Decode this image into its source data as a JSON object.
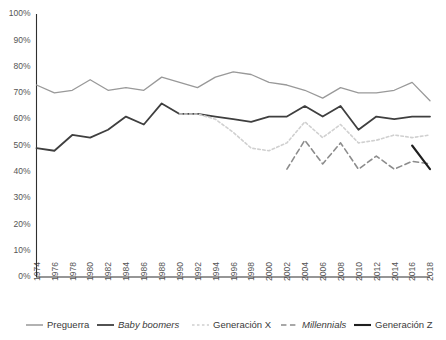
{
  "chart_data": {
    "type": "line",
    "title": "",
    "xlabel": "",
    "ylabel": "",
    "ylim": [
      0,
      100
    ],
    "xlim": [
      1974,
      2018
    ],
    "grid": false,
    "legend_position": "bottom",
    "ytick_labels": [
      "0%",
      "10%",
      "20%",
      "30%",
      "40%",
      "50%",
      "60%",
      "70%",
      "80%",
      "90%",
      "100%"
    ],
    "ytick_values": [
      0,
      10,
      20,
      30,
      40,
      50,
      60,
      70,
      80,
      90,
      100
    ],
    "xtick_labels": [
      "1974",
      "1976",
      "1978",
      "1980",
      "1982",
      "1984",
      "1986",
      "1988",
      "1990",
      "1992",
      "1994",
      "1996",
      "1998",
      "2000",
      "2002",
      "2004",
      "2006",
      "2008",
      "2010",
      "2012",
      "2014",
      "2016",
      "2018"
    ],
    "xtick_values": [
      1974,
      1976,
      1978,
      1980,
      1982,
      1984,
      1986,
      1988,
      1990,
      1992,
      1994,
      1996,
      1998,
      2000,
      2002,
      2004,
      2006,
      2008,
      2010,
      2012,
      2014,
      2016,
      2018
    ],
    "series": [
      {
        "name": "Preguerra",
        "color": "#999999",
        "style": "solid",
        "width": 1.3,
        "italic": false,
        "x": [
          1974,
          1976,
          1978,
          1980,
          1982,
          1984,
          1986,
          1988,
          1990,
          1992,
          1994,
          1996,
          1998,
          2000,
          2002,
          2004,
          2006,
          2008,
          2010,
          2012,
          2014,
          2016,
          2018
        ],
        "values": [
          73,
          70,
          71,
          75,
          71,
          72,
          71,
          76,
          74,
          72,
          76,
          78,
          77,
          74,
          73,
          71,
          68,
          72,
          70,
          70,
          71,
          74,
          67
        ]
      },
      {
        "name": "Baby boomers",
        "color": "#3f3f3f",
        "style": "solid",
        "width": 1.8,
        "italic": true,
        "x": [
          1974,
          1976,
          1978,
          1980,
          1982,
          1984,
          1986,
          1988,
          1990,
          1992,
          1994,
          1996,
          1998,
          2000,
          2002,
          2004,
          2006,
          2008,
          2010,
          2012,
          2014,
          2016,
          2018
        ],
        "values": [
          49,
          48,
          54,
          53,
          56,
          61,
          58,
          66,
          62,
          62,
          61,
          60,
          59,
          61,
          61,
          65,
          61,
          65,
          56,
          61,
          60,
          61,
          61
        ]
      },
      {
        "name": "Generación X",
        "color": "#d0d0d0",
        "style": "dotted",
        "width": 1.6,
        "italic": false,
        "x": [
          1990,
          1992,
          1994,
          1996,
          1998,
          2000,
          2002,
          2004,
          2006,
          2008,
          2010,
          2012,
          2014,
          2016,
          2018
        ],
        "values": [
          62,
          62,
          60,
          55,
          49,
          48,
          51,
          59,
          53,
          58,
          51,
          52,
          54,
          53,
          54
        ]
      },
      {
        "name": "Millennials",
        "color": "#8c8c8c",
        "style": "dashed",
        "width": 1.6,
        "italic": true,
        "x": [
          2002,
          2004,
          2006,
          2008,
          2010,
          2012,
          2014,
          2016,
          2018
        ],
        "values": [
          41,
          52,
          43,
          51,
          41,
          46,
          41,
          44,
          43
        ]
      },
      {
        "name": "Generación Z",
        "color": "#1f1f1f",
        "style": "solid",
        "width": 2.1,
        "italic": false,
        "x": [
          2016,
          2018
        ],
        "values": [
          50,
          41
        ]
      }
    ]
  }
}
